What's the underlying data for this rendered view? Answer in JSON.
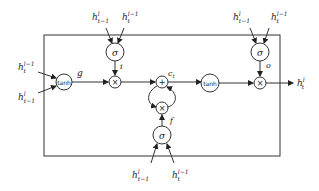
{
  "diagram": {
    "type": "LSTM cell",
    "nodes": {
      "tanh_g": {
        "label": "tanh",
        "output_label": "g"
      },
      "sigma_i": {
        "label": "σ",
        "output_label": "i"
      },
      "mul_i": {
        "label": "×"
      },
      "add_c": {
        "label": "+",
        "output_label": "c",
        "output_sub": "t"
      },
      "mul_f": {
        "label": "×"
      },
      "sigma_f": {
        "label": "σ",
        "output_label": "f"
      },
      "tanh_c": {
        "label": "tanh"
      },
      "sigma_o": {
        "label": "σ",
        "output_label": "o"
      },
      "mul_o": {
        "label": "×"
      }
    },
    "inputs": {
      "g_top": {
        "base": "h",
        "sup": "l−1",
        "sub": "t"
      },
      "g_bottom": {
        "base": "h",
        "sup": "l",
        "sub": "t−1"
      },
      "i_left": {
        "base": "h",
        "sup": "l",
        "sub": "t−1"
      },
      "i_right": {
        "base": "h",
        "sup": "l−1",
        "sub": "t"
      },
      "o_left": {
        "base": "h",
        "sup": "l",
        "sub": "t−1"
      },
      "o_right": {
        "base": "h",
        "sup": "l−1",
        "sub": "t"
      },
      "f_left": {
        "base": "h",
        "sup": "l",
        "sub": "t−1"
      },
      "f_right": {
        "base": "h",
        "sup": "l−1",
        "sub": "t"
      }
    },
    "output": {
      "base": "h",
      "sup": "l",
      "sub": "t"
    }
  }
}
